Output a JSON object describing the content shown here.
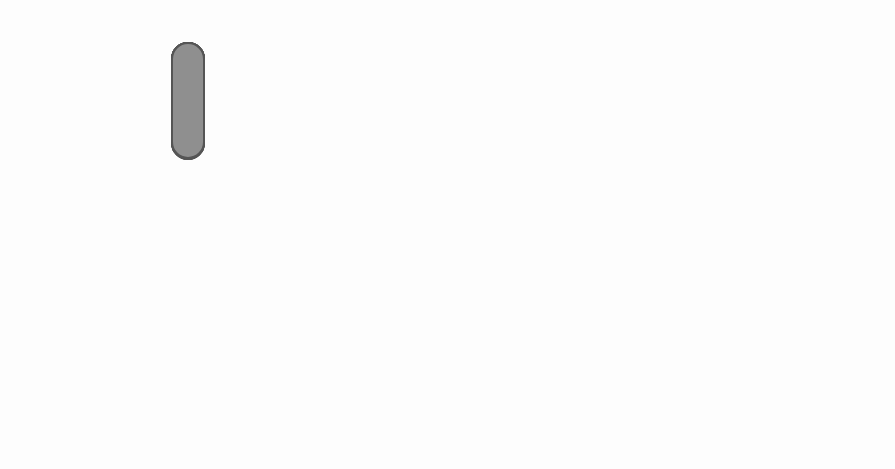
{
  "chromosomes": {
    "normal": {
      "caption_line1": "NORMAL",
      "caption_line2": "(DOMINANT)",
      "color": "#8f8f8f",
      "traits": [
        "Long aristae",
        "Long legs",
        "Normal wings",
        "Grey body",
        "Red eyes"
      ]
    },
    "mutant": {
      "caption_line1": "MUTANT",
      "caption_line2": "(RECESSIVE)",
      "color": "#4a4a4a",
      "band_color": "#c8c8c8",
      "traits": [
        "Short aristae",
        "Short legs",
        "Curly wings",
        "Black body",
        "Brown eyes"
      ]
    }
  },
  "fly_normal": {
    "labels": {
      "aristae": "Long",
      "eyes": "Red",
      "legs": "Long",
      "wings": "Normal",
      "body": "Grey"
    }
  },
  "fly_mutant": {
    "labels": {
      "aristae": "Short",
      "eyes": "Brown",
      "legs": "Short",
      "wings": "Curly",
      "body": "Black"
    }
  }
}
